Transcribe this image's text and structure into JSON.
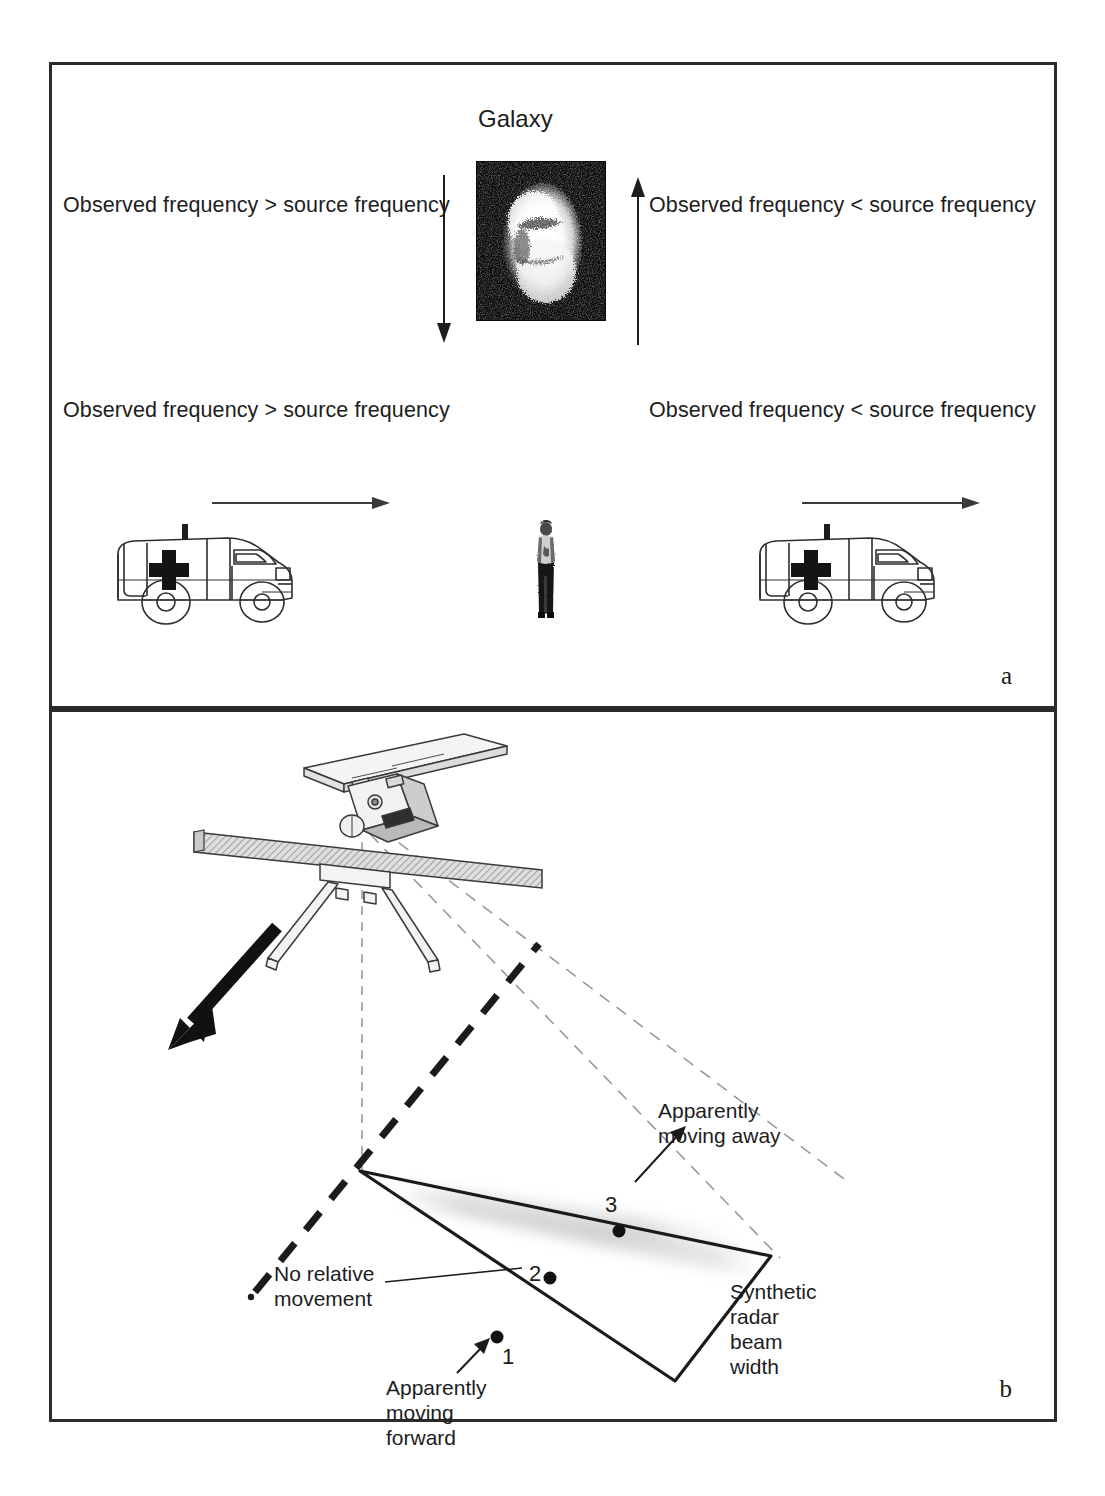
{
  "figure": {
    "panels": [
      {
        "letter": "a",
        "name": "doppler-galaxy-ambulance-panel",
        "title": "Galaxy",
        "labels": {
          "galaxy_left": "Observed frequency > source frequency",
          "galaxy_right": "Observed frequency < source frequency",
          "ambulance_left": "Observed frequency > source frequency",
          "ambulance_right": "Observed frequency < source frequency"
        },
        "icons": {
          "galaxy_image": "galaxy-photo",
          "down_arrow": "down-arrow-icon",
          "up_arrow": "up-arrow-icon",
          "ambulance_left": "ambulance-icon",
          "ambulance_right": "ambulance-icon",
          "observer": "standing-person-icon",
          "motion_arrow_left": "right-arrow-icon",
          "motion_arrow_right": "right-arrow-icon"
        }
      },
      {
        "letter": "b",
        "name": "synthetic-aperture-radar-panel",
        "labels": {
          "apparently_moving_away": "Apparently\nmoving away",
          "no_relative_movement": "No relative\nmovement",
          "apparently_moving_forward": "Apparently\nmoving\nforward",
          "synthetic_radar_beam_width": "Synthetic\nradar\nbeam\nwidth"
        },
        "points": [
          {
            "id": "1",
            "label": "1",
            "meaning": "Apparently moving forward"
          },
          {
            "id": "2",
            "label": "2",
            "meaning": "No relative movement"
          },
          {
            "id": "3",
            "label": "3",
            "meaning": "Apparently moving away"
          }
        ],
        "icons": {
          "satellite": "satellite-radar-icon",
          "flight_direction_arrow": "thick-down-left-arrow-icon",
          "ground_track": "bold-dashed-ground-track",
          "beam_footprint": "radar-beam-footprint",
          "beam_edges": "dashed-beam-edge-lines",
          "nadir_line": "dashed-nadir-line"
        }
      }
    ]
  },
  "colors": {
    "ink": "#1d1d1d",
    "border": "#2b2b2b",
    "panel_fill": "#cfcfcf",
    "beam_shade": "#d8d8d8",
    "dash_light": "#9a9a9a"
  }
}
